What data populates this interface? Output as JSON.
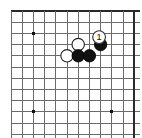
{
  "figure": {
    "kind": "go-board-diagram",
    "board": {
      "columns": 12,
      "rows": 12,
      "cell_size": 11.2,
      "origin_x": 11.0,
      "origin_y": 11.0,
      "line_color": "#6b6b6b",
      "line_width": 1.0,
      "edge_color": "#2a2a2a",
      "edge_width": 2.0,
      "board_color": "#ffffff",
      "top_edge_row": 0,
      "right_edge_col": 11
    },
    "star_points": [
      {
        "col": 2,
        "row": 2
      },
      {
        "col": 2,
        "row": 9
      },
      {
        "col": 9,
        "row": 9
      }
    ],
    "stones": [
      {
        "id": "w1",
        "color": "white",
        "col": 6,
        "row": 3,
        "label": ""
      },
      {
        "id": "w2",
        "color": "white",
        "col": 5,
        "row": 4,
        "label": ""
      },
      {
        "id": "b1",
        "color": "black",
        "col": 8,
        "row": 3,
        "label": "1"
      },
      {
        "id": "b2",
        "color": "black",
        "col": 6,
        "row": 4,
        "label": ""
      },
      {
        "id": "b3",
        "color": "black",
        "col": 7,
        "row": 4,
        "label": ""
      }
    ],
    "stone_style": {
      "radius": 6.2,
      "black_fill": "#111111",
      "black_stroke": "#000000",
      "white_fill": "#ffffff",
      "white_stroke": "#222222",
      "label_circle_fill": "#ffffff",
      "label_circle_stroke": "#333333",
      "label_text_color": "#111111",
      "label_font_size": 9
    },
    "move_marker": {
      "number": "1",
      "on_stone": "b1",
      "color": "black",
      "description": "Black plays move 1"
    }
  }
}
